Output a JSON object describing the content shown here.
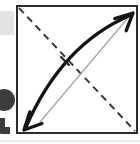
{
  "figure": {
    "title": "Scanned diagram: square frame with dashed diagonal and curved double-headed arrow",
    "background_color": "#ffffff",
    "width": 140,
    "height": 144,
    "frame": {
      "label": "square frame",
      "stroke_color": "#2b2b2b",
      "stroke_width": 2,
      "x": 17,
      "y": 6,
      "width": 120,
      "height": 127
    },
    "dashed_diagonal": {
      "label": "dashed diagonal line",
      "stroke_color": "#3a3a3a",
      "stroke_width": 2,
      "dash_pattern": "7 5",
      "x1": 19,
      "y1": 8,
      "x2": 135,
      "y2": 131
    },
    "straight_chord": {
      "label": "thin straight reference line",
      "stroke_color": "#a9a9a9",
      "stroke_width": 1.4,
      "x1": 40,
      "y1": 122,
      "x2": 127,
      "y2": 19
    },
    "curved_arrow": {
      "label": "thick curved double-headed arrow",
      "stroke_color": "#141414",
      "stroke_width": 3.4,
      "start": {
        "x": 26,
        "y": 127
      },
      "end": {
        "x": 131,
        "y": 15
      },
      "control": {
        "x": 62,
        "y": 44
      },
      "curvature": "bows upward above the straight line",
      "arrowheads": [
        {
          "name": "lower-left-arrowhead",
          "direction": "down-left",
          "tip_x": 24,
          "tip_y": 130
        },
        {
          "name": "upper-right-arrowhead",
          "direction": "up-right",
          "tip_x": 133,
          "tip_y": 13
        }
      ]
    },
    "tick_mark": {
      "label": "short tick across the curve",
      "stroke_color": "#1a1a1a",
      "stroke_width": 2,
      "x1": 61,
      "y1": 57,
      "x2": 69,
      "y2": 65
    },
    "margin_artifacts": [
      {
        "name": "gray-smudge",
        "description": "light gray scan smudge at left margin",
        "color": "#e3e3e3",
        "x": 0,
        "y": 11,
        "width": 14,
        "height": 24
      },
      {
        "name": "cropped-glyph",
        "description": "dark cropped letter glyph at left margin",
        "color": "#3c3c3c",
        "x": 0,
        "y": 86,
        "width": 14,
        "height": 48
      }
    ],
    "baseline_rule": {
      "label": "faint scan rule below frame",
      "color": "#d6d6d6",
      "y": 141
    }
  }
}
